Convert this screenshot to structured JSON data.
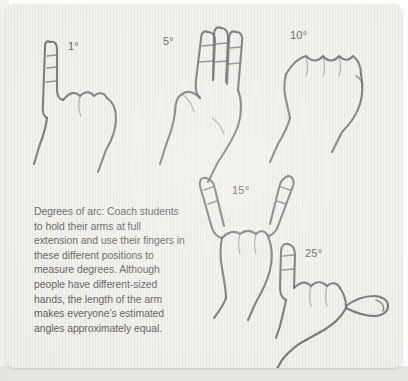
{
  "figure": {
    "paper_color": "#eceae3",
    "ink_color": "#55525a",
    "caption": "Degrees of arc: Coach students to hold their arms at full extension and use their fingers in these different positions to measure degrees. Although people have different-sized hands, the length of the arm makes everyone's estimated angles approximately equal."
  },
  "hands": [
    {
      "label": "1°",
      "degrees": 1,
      "gesture": "index-finger-extended",
      "description": "One finger raised"
    },
    {
      "label": "5°",
      "degrees": 5,
      "gesture": "three-fingers-extended",
      "description": "Three fingers raised together"
    },
    {
      "label": "10°",
      "degrees": 10,
      "gesture": "closed-fist",
      "description": "Closed fist"
    },
    {
      "label": "15°",
      "degrees": 15,
      "gesture": "index-and-pinky-spread",
      "description": "Index and little finger spread apart"
    },
    {
      "label": "25°",
      "degrees": 25,
      "gesture": "thumb-and-pinky-spread",
      "description": "Thumb and little finger spread apart"
    }
  ]
}
